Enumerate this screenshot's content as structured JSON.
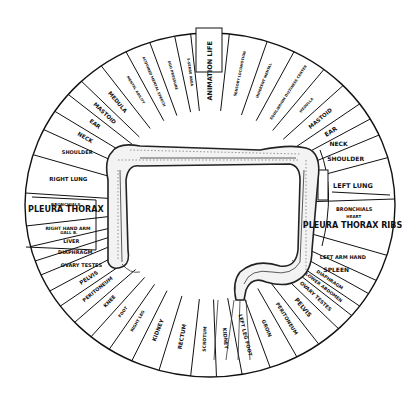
{
  "diagram": {
    "geometry": {
      "cx": 210,
      "cy": 205,
      "rx": 185,
      "ry": 172
    },
    "segments": [
      {
        "label": "ANIMATION LIFE",
        "angle": 0,
        "size": 6.5
      },
      {
        "label": "SENSORY LOCOMOTION",
        "angle": 12,
        "size": 3.5
      },
      {
        "label": "INHERENT MENTAL",
        "angle": 22,
        "size": 3.5
      },
      {
        "label": "EQUILIBRIUM DIZZINESS CENTER",
        "angle": 33,
        "size": 3.5
      },
      {
        "label": "MEDULLA",
        "angle": 42,
        "size": 3.5
      },
      {
        "label": "MASTOID",
        "angle": 50,
        "size": 5.5
      },
      {
        "label": "EAR",
        "angle": 57,
        "size": 6
      },
      {
        "label": "NECK",
        "angle": 63,
        "size": 6
      },
      {
        "label": "SHOULDER",
        "angle": 70,
        "size": 6
      },
      {
        "label": "LEFT LUNG",
        "angle": 82,
        "size": 6.5
      },
      {
        "label": "BRONCHIALS",
        "angle": 92,
        "size": 5
      },
      {
        "label": "HEART",
        "angle": 95,
        "size": 4
      },
      {
        "label": "PLEURA THORAX RIBS",
        "angle": 99,
        "size": 8
      },
      {
        "label": "LEFT ARM HAND",
        "angle": 113,
        "size": 5
      },
      {
        "label": "SPLEEN",
        "angle": 119,
        "size": 6
      },
      {
        "label": "DIAPHRAGM",
        "angle": 124,
        "size": 4.5
      },
      {
        "label": "LOWER ABDOMEN",
        "angle": 128,
        "size": 4.5
      },
      {
        "label": "OVARY TESTES",
        "angle": 133,
        "size": 5
      },
      {
        "label": "PELVIS",
        "angle": 140,
        "size": 6
      },
      {
        "label": "PERITONEUM",
        "angle": 148,
        "size": 5
      },
      {
        "label": "GROIN",
        "angle": 157,
        "size": 5
      },
      {
        "label": "LEFT LEG FOOT",
        "angle": 166,
        "size": 5
      },
      {
        "label": "KIDNEY",
        "angle": 174,
        "size": 5
      },
      {
        "label": "SCROTUM",
        "angle": 182,
        "size": 4.5
      },
      {
        "label": "RECTUM",
        "angle": 191,
        "size": 5.5
      },
      {
        "label": "KIDNEY",
        "angle": 201,
        "size": 5.5
      },
      {
        "label": "RIGHT LEG",
        "angle": 210,
        "size": 4
      },
      {
        "label": "FOOT",
        "angle": 217,
        "size": 4
      },
      {
        "label": "KNEE",
        "angle": 224,
        "size": 5
      },
      {
        "label": "PERITONEUM",
        "angle": 231,
        "size": 5
      },
      {
        "label": "PELVIS",
        "angle": 237,
        "size": 5.5
      },
      {
        "label": "OVARY TESTES",
        "angle": 243,
        "size": 5
      },
      {
        "label": "DIAPHRAGM",
        "angle": 249,
        "size": 5
      },
      {
        "label": "LIVER",
        "angle": 254,
        "size": 5
      },
      {
        "label": "GALL B.",
        "angle": 258,
        "size": 4
      },
      {
        "label": "RIGHT HAND ARM",
        "angle": 260,
        "size": 4.5
      },
      {
        "label": "PLEURA THORAX",
        "angle": 268,
        "size": 8
      },
      {
        "label": "BRONCHIALS",
        "angle": 270,
        "size": 4
      },
      {
        "label": "RIGHT LUNG",
        "angle": 281,
        "size": 5.5
      },
      {
        "label": "SHOULDER",
        "angle": 293,
        "size": 5
      },
      {
        "label": "NECK",
        "angle": 300,
        "size": 5.5
      },
      {
        "label": "EAR",
        "angle": 307,
        "size": 5.5
      },
      {
        "label": "MASTOID",
        "angle": 313,
        "size": 5.5
      },
      {
        "label": "MEDULA",
        "angle": 320,
        "size": 5.5
      },
      {
        "label": "MENTAL ABILITY",
        "angle": 329,
        "size": 3.5
      },
      {
        "label": "ACQUIRED MENTAL SPEECH",
        "angle": 337,
        "size": 3.5
      },
      {
        "label": "EGO PRESSURE",
        "angle": 345,
        "size": 3.5
      },
      {
        "label": "5-SENSE AREA",
        "angle": 352,
        "size": 3.5
      }
    ],
    "spoke_angles": [
      -6,
      6,
      18,
      27,
      38,
      46,
      54,
      60,
      66,
      74,
      88,
      107,
      116,
      121,
      126,
      130,
      136,
      144,
      152,
      161,
      170,
      178,
      186,
      196,
      205,
      213,
      220,
      227,
      234,
      240,
      246,
      251,
      256,
      263,
      274,
      287,
      296,
      303,
      310,
      316,
      324,
      333,
      341,
      349
    ]
  }
}
